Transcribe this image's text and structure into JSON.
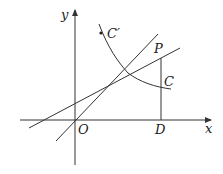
{
  "diagram": {
    "type": "coordinate-geometry-figure",
    "axes": {
      "x_label": "x",
      "y_label": "y",
      "origin_label": "O"
    },
    "points": {
      "P": "P",
      "D": "D",
      "C_prime": "C′"
    },
    "curves": {
      "C": "C"
    },
    "colors": {
      "stroke": "#333333",
      "background": "#ffffff"
    }
  }
}
